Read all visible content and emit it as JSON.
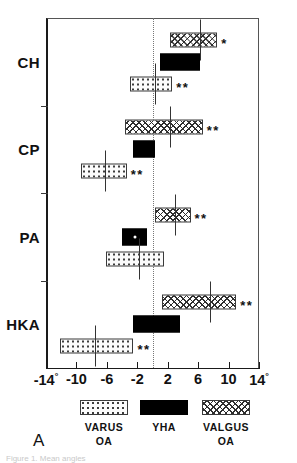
{
  "panel_letter": "A",
  "figure_caption": "Figure 1. Mean angles",
  "axis": {
    "x_tick_labels": [
      "-14°",
      "-10",
      "-6",
      "-2",
      "2",
      "6",
      "10",
      "14°"
    ],
    "x_tick_values": [
      -14,
      -10,
      -6,
      -2,
      2,
      6,
      10,
      14
    ],
    "y_tick_labels": [
      "CH",
      "CP",
      "PA",
      "HKA"
    ],
    "x_unit": "degrees",
    "zero_reference": 0
  },
  "legend": {
    "items": [
      {
        "key": "varus",
        "line1": "VARUS",
        "line2": "OA",
        "pattern": "dotted"
      },
      {
        "key": "yha",
        "line1": "YHA",
        "line2": "",
        "pattern": "solid-black"
      },
      {
        "key": "valgus",
        "line1": "VALGUS",
        "line2": "OA",
        "pattern": "cross-hatched"
      }
    ]
  },
  "chart_data": {
    "type": "bar",
    "title": "",
    "subtitle": "",
    "xlabel": "",
    "ylabel": "",
    "xlim": [
      -14,
      14
    ],
    "grid": false,
    "orientation": "horizontal",
    "legend_position": "bottom",
    "annotation_note": "* and ** denote significance levels",
    "categories": [
      "CH",
      "CP",
      "PA",
      "HKA"
    ],
    "series": [
      {
        "name": "VALGUS OA",
        "pattern": "cross-hatched",
        "bars": [
          {
            "category": "CH",
            "start": 2.3,
            "end": 8.5,
            "marker": 6.3,
            "significance": "*"
          },
          {
            "category": "CP",
            "start": -3.6,
            "end": 6.6,
            "marker": 2.3,
            "significance": "**"
          },
          {
            "category": "PA",
            "start": 0.3,
            "end": 5.0,
            "marker": 3.0,
            "significance": "**"
          },
          {
            "category": "HKA",
            "start": 1.3,
            "end": 11.0,
            "marker": 7.5,
            "significance": "**"
          }
        ]
      },
      {
        "name": "YHA",
        "pattern": "solid-black",
        "bars": [
          {
            "category": "CH",
            "start": 1.0,
            "end": 6.3,
            "marker": null,
            "significance": ""
          },
          {
            "category": "CP",
            "start": -2.5,
            "end": 0.3,
            "marker": null,
            "significance": ""
          },
          {
            "category": "PA",
            "start": -4.0,
            "end": -0.7,
            "marker": -2.3,
            "significance": ""
          },
          {
            "category": "HKA",
            "start": -2.6,
            "end": 3.6,
            "marker": null,
            "significance": ""
          }
        ]
      },
      {
        "name": "VARUS OA",
        "pattern": "dotted",
        "bars": [
          {
            "category": "CH",
            "start": -3.0,
            "end": 2.6,
            "marker": 0.3,
            "significance": "**"
          },
          {
            "category": "CP",
            "start": -9.4,
            "end": -3.4,
            "marker": -6.3,
            "significance": "**"
          },
          {
            "category": "PA",
            "start": -6.1,
            "end": 1.5,
            "marker": -1.8,
            "significance": ""
          },
          {
            "category": "HKA",
            "start": -12.1,
            "end": -2.5,
            "marker": -7.5,
            "significance": "**"
          }
        ]
      }
    ]
  }
}
